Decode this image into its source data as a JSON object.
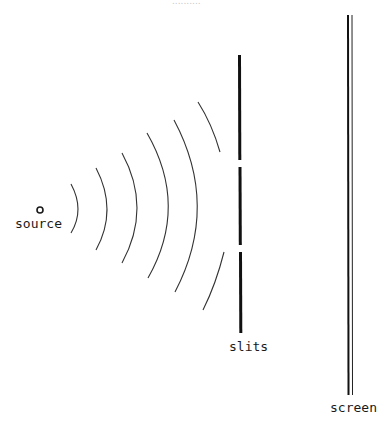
{
  "title_fragment": "..........",
  "labels": {
    "source": "source",
    "slits": "slits",
    "screen": "screen"
  },
  "colors": {
    "ink": "#1a1a1a",
    "wave": "#333333",
    "background": "#ffffff"
  },
  "elements": {
    "source": {
      "cx": 40,
      "cy": 210,
      "r": 3
    },
    "wavefronts": [
      {
        "top": [
          71,
          184
        ],
        "peak": [
          78,
          210
        ],
        "bottom": [
          71,
          233
        ]
      },
      {
        "top": [
          96,
          168
        ],
        "peak": [
          107,
          210
        ],
        "bottom": [
          96,
          250
        ]
      },
      {
        "top": [
          122,
          153
        ],
        "peak": [
          137,
          210
        ],
        "bottom": [
          122,
          263
        ]
      },
      {
        "top": [
          147,
          133
        ],
        "peak": [
          168,
          210
        ],
        "bottom": [
          148,
          278
        ]
      },
      {
        "top": [
          174,
          120
        ],
        "peak": [
          197,
          210
        ],
        "bottom": [
          175,
          292
        ]
      }
    ],
    "partial_wavefront": {
      "upper": {
        "from": [
          198,
          102
        ],
        "to": [
          220,
          152
        ]
      },
      "lower": {
        "from": [
          224,
          252
        ],
        "to": [
          203,
          310
        ]
      }
    },
    "slit_barrier": {
      "x": 240,
      "segments": [
        [
          55,
          160
        ],
        [
          167,
          245
        ],
        [
          252,
          333
        ]
      ]
    },
    "screen": {
      "x_thick": 348,
      "x_thin": 352,
      "y_top": 15,
      "y_bottom": 395
    }
  }
}
